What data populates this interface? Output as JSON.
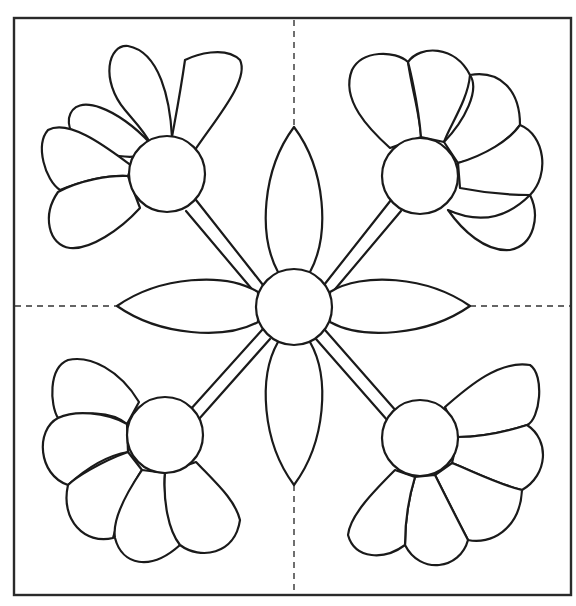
{
  "pattern": {
    "type": "quilt-block-line-art",
    "colors": {
      "line": "#1a1a1a",
      "background": "#ffffff",
      "frame": "#2a2a2a"
    },
    "frame": {
      "x": 14,
      "y": 18,
      "w": 557,
      "h": 577
    },
    "guides": {
      "vx": 294,
      "hy": 306
    },
    "center": {
      "cx": 294,
      "cy": 307,
      "r": 38
    },
    "leaves": [
      {
        "name": "top",
        "tip": [
          294,
          127
        ]
      },
      {
        "name": "bottom",
        "tip": [
          294,
          485
        ]
      },
      {
        "name": "left",
        "tip": [
          117,
          306
        ]
      },
      {
        "name": "right",
        "tip": [
          470,
          306
        ]
      }
    ],
    "flowers": [
      {
        "name": "top-left",
        "cx": 167,
        "cy": 174,
        "r": 38,
        "petals": 5
      },
      {
        "name": "top-right",
        "cx": 420,
        "cy": 176,
        "r": 38,
        "petals": 5
      },
      {
        "name": "bottom-left",
        "cx": 165,
        "cy": 435,
        "r": 38,
        "petals": 5
      },
      {
        "name": "bottom-right",
        "cx": 420,
        "cy": 438,
        "r": 38,
        "petals": 5
      }
    ]
  }
}
